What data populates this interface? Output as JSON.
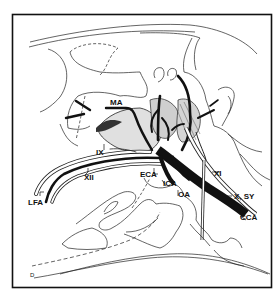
{
  "diagram": {
    "type": "anatomical-line-drawing",
    "colors": {
      "background": "#ffffff",
      "ink": "#111111",
      "shading": "#bdbdbd"
    },
    "labels": {
      "ma": "MA",
      "ix": "IX",
      "xii": "XII",
      "lfa": "LFA",
      "eca": "ECA",
      "ica": "ICA",
      "oa": "OA",
      "xi": "XI",
      "x_sy": "X, SY",
      "cca": "CCA",
      "corner_mark": "D"
    }
  }
}
